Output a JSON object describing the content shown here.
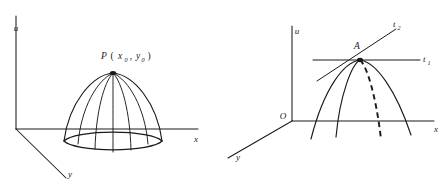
{
  "figures": [
    {
      "id": "left",
      "name": "dome-surface-figure",
      "axes": {
        "vertical_label": "u",
        "horizontal_label": "x",
        "depth_label": "y"
      },
      "point_label": {
        "name": "P",
        "open_paren": "(",
        "arg1": "x",
        "arg1_sub": "0",
        "comma": ",",
        "arg2": "y",
        "arg2_sub": "0",
        "close_paren": ")",
        "full": "P(x0 , y0)"
      },
      "description": "Dome-shaped surface with elliptical base and five meridian curves meeting at apex P(x0,y0)",
      "meridian_count": 5
    },
    {
      "id": "right",
      "name": "tangent-lines-figure",
      "axes": {
        "vertical_label": "u",
        "horizontal_label": "x",
        "depth_label": "y",
        "origin_label": "O"
      },
      "point_label": "A",
      "tangent_lines": [
        {
          "label": "t",
          "subscript": "1",
          "full": "t1",
          "orientation": "horizontal"
        },
        {
          "label": "t",
          "subscript": "2",
          "full": "t2",
          "orientation": "sloped-up-right"
        }
      ],
      "curves": {
        "solid_count": 3,
        "dashed_count": 1,
        "description": "Three solid downward parabolic curves and one dashed curve passing through point A"
      }
    }
  ],
  "colors": {
    "ink": "#1a1a1a",
    "background": "#ffffff"
  }
}
